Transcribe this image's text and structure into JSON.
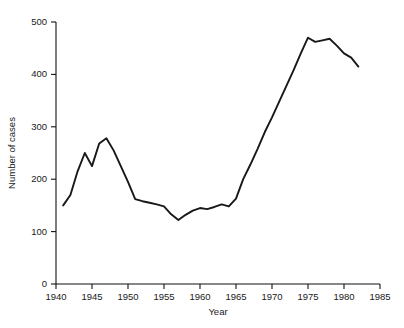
{
  "chart_data": {
    "type": "line",
    "title": "",
    "xlabel": "Year",
    "ylabel": "Number of cases",
    "xlim": [
      1940,
      1985
    ],
    "ylim": [
      0,
      500
    ],
    "grid": false,
    "legend": null,
    "xticks": [
      1940,
      1945,
      1950,
      1955,
      1960,
      1965,
      1970,
      1975,
      1980,
      1985
    ],
    "xticklabels": [
      "1940",
      "1945",
      "1950",
      "1955",
      "1960",
      "1965",
      "1970",
      "1975",
      "1980",
      "1985"
    ],
    "yticks": [
      0,
      100,
      200,
      300,
      400,
      500
    ],
    "yticklabels": [
      "0",
      "100",
      "200",
      "300",
      "400",
      "500"
    ],
    "line_color": "#16181a",
    "series": [
      {
        "name": "Number of cases",
        "x": [
          1941,
          1942,
          1943,
          1944,
          1945,
          1946,
          1947,
          1948,
          1949,
          1950,
          1951,
          1952,
          1953,
          1954,
          1955,
          1956,
          1957,
          1958,
          1959,
          1960,
          1961,
          1962,
          1963,
          1964,
          1965,
          1966,
          1967,
          1968,
          1969,
          1970,
          1971,
          1972,
          1973,
          1974,
          1975,
          1976,
          1977,
          1978,
          1979,
          1980,
          1981,
          1982
        ],
        "values": [
          150,
          170,
          215,
          250,
          225,
          268,
          278,
          255,
          225,
          195,
          162,
          158,
          155,
          152,
          148,
          133,
          122,
          132,
          140,
          145,
          143,
          147,
          152,
          148,
          163,
          200,
          228,
          258,
          290,
          318,
          348,
          378,
          408,
          440,
          470,
          462,
          465,
          468,
          455,
          440,
          432,
          415
        ]
      }
    ]
  },
  "figure": {
    "background_color": "#ffffff"
  }
}
